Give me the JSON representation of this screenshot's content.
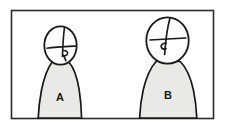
{
  "scene": {
    "title": "Two Figures Sketch",
    "medium": "hand-drawn line sketch",
    "background_color": "#ffffff",
    "ink_color": "#17181a",
    "body_fill_color": "#e9e9e7",
    "frame": {
      "name": "rectangular border",
      "stroke_color": "#2a2b2d",
      "x": 11,
      "y": 10,
      "width": 203,
      "height": 109
    }
  },
  "figures": [
    {
      "id": "a",
      "label": "A",
      "label_x": 60,
      "label_y": 101,
      "size": "smaller",
      "position": "left",
      "head": {
        "center_x": 60,
        "center_y": 45,
        "radius_x": 16,
        "radius_y": 19
      },
      "face": {
        "vertical_line": "from top of head down through center",
        "horizontal_line": "across face, slightly below center",
        "nose_mark": "small hooked stroke right of center"
      },
      "body": {
        "shape": "tapered torso widening downward",
        "top_y": 62,
        "bottom_y": 118,
        "bottom_half_width": 27
      }
    },
    {
      "id": "b",
      "label": "B",
      "label_x": 168,
      "label_y": 99,
      "size": "larger",
      "position": "right",
      "head": {
        "center_x": 167,
        "center_y": 40,
        "radius_x": 21,
        "radius_y": 23
      },
      "face": {
        "vertical_line": "from top of head down through center",
        "horizontal_line": "across face, slightly below center",
        "nose_mark": "small hooked stroke left of center"
      },
      "body": {
        "shape": "tapered torso widening downward",
        "top_y": 61,
        "bottom_y": 118,
        "bottom_half_width": 32
      }
    }
  ]
}
